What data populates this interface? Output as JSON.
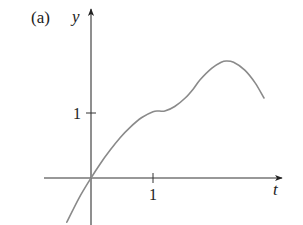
{
  "chart_data": {
    "type": "line",
    "title": "(a)",
    "xlabel": "t",
    "ylabel": "y",
    "x_ticks": [
      {
        "value": 1,
        "label": "1"
      }
    ],
    "y_ticks": [
      {
        "value": 1,
        "label": "1"
      }
    ],
    "grid": false,
    "legend": null,
    "xlim": [
      -0.76,
      3.1
    ],
    "ylim": [
      -0.68,
      2.63
    ],
    "series": [
      {
        "name": "y(t)",
        "x": [
          -0.39,
          -0.2,
          0.0,
          0.15,
          0.31,
          0.47,
          0.63,
          0.82,
          1.0,
          1.1,
          1.19,
          1.35,
          1.52,
          1.65,
          1.76,
          1.95,
          2.1,
          2.18,
          2.3,
          2.48,
          2.65,
          2.79
        ],
        "y": [
          -0.68,
          -0.32,
          0.0,
          0.22,
          0.43,
          0.62,
          0.78,
          0.93,
          1.02,
          1.03,
          1.03,
          1.1,
          1.23,
          1.37,
          1.51,
          1.69,
          1.78,
          1.8,
          1.78,
          1.66,
          1.46,
          1.23
        ]
      }
    ],
    "annotations": []
  },
  "figure": {
    "panel_label": "(a)",
    "x_axis_label": "t",
    "y_axis_label": "y",
    "x_tick_label": "1",
    "y_tick_label": "1",
    "colors": {
      "axes": "#333333",
      "curve": "#8a8a8a",
      "text": "#222222"
    }
  }
}
